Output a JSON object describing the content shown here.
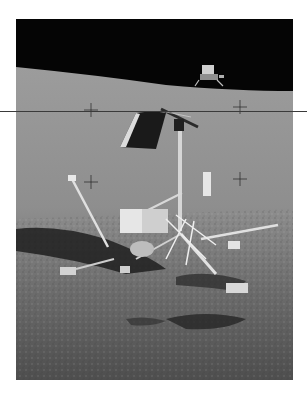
{
  "image": {
    "subject": "Surveyor 3 spacecraft on lunar surface with Apollo 12 lunar module on horizon",
    "colors": {
      "sky": "#050505",
      "regolith_light": "#a8a8a8",
      "regolith_mid": "#8a8a8a",
      "regolith_dark": "#5a5a5a",
      "shadow": "#1e1e1e",
      "page_background": "#ffffff",
      "overlay_line": "#3a3a3a"
    }
  }
}
